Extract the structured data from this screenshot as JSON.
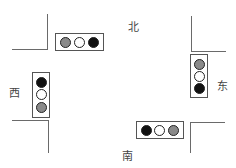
{
  "diagram": {
    "type": "traffic-intersection",
    "directions": {
      "north": "北",
      "south": "南",
      "east": "东",
      "west": "西"
    },
    "colors": {
      "black": "#111111",
      "white": "#ffffff",
      "gray": "#8a8a8a"
    },
    "signals": {
      "north": {
        "orientation": "horizontal",
        "lights": [
          "gray",
          "white",
          "black"
        ]
      },
      "east": {
        "orientation": "vertical",
        "lights": [
          "gray",
          "white",
          "black"
        ]
      },
      "south": {
        "orientation": "horizontal",
        "lights": [
          "black",
          "white",
          "gray"
        ]
      },
      "west": {
        "orientation": "vertical",
        "lights": [
          "black",
          "white",
          "gray"
        ]
      }
    }
  }
}
